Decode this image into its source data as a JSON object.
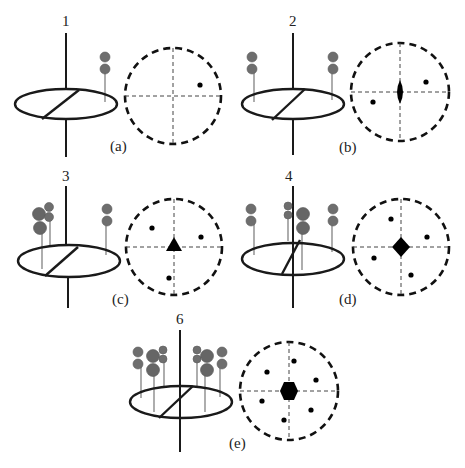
{
  "figure": {
    "panels": [
      {
        "id": "a",
        "label": "(a)",
        "axis_order": "1",
        "symmetry_symbol": "none",
        "projection_points": 1
      },
      {
        "id": "b",
        "label": "(b)",
        "axis_order": "2",
        "symmetry_symbol": "lens (2-fold)",
        "projection_points": 2
      },
      {
        "id": "c",
        "label": "(c)",
        "axis_order": "3",
        "symmetry_symbol": "triangle (3-fold)",
        "projection_points": 3
      },
      {
        "id": "d",
        "label": "(d)",
        "axis_order": "4",
        "symmetry_symbol": "square (4-fold)",
        "projection_points": 4
      },
      {
        "id": "e",
        "label": "(e)",
        "axis_order": "6",
        "symmetry_symbol": "hexagon (6-fold)",
        "projection_points": 6
      }
    ]
  },
  "colors": {
    "line": "#1a1a1a",
    "sphere": "#6e6e6e",
    "stick": "#777777",
    "background": "#ffffff"
  }
}
